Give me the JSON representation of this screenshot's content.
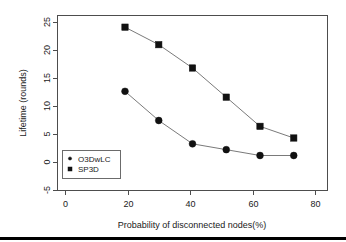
{
  "chart_data": {
    "type": "line",
    "title": "",
    "xlabel": "Probability of disconnected nodes(%)",
    "ylabel": "Lifetime (rounds)",
    "xlim": [
      0,
      80
    ],
    "ylim": [
      -5,
      25
    ],
    "xticks": [
      0,
      20,
      40,
      60,
      80
    ],
    "yticks": [
      -5,
      0,
      5,
      10,
      15,
      20,
      25
    ],
    "xtick_labels": [
      "0",
      "20",
      "40",
      "60",
      "80"
    ],
    "ytick_labels": [
      "-5",
      "0",
      "5",
      "10",
      "15",
      "20",
      "25"
    ],
    "grid": false,
    "legend_position": "lower-left-inside",
    "x": [
      20,
      30,
      40,
      50,
      60,
      70
    ],
    "series": [
      {
        "name": "O3DwLC",
        "marker": "circle",
        "values": [
          12,
          7,
          3,
          2,
          1,
          1
        ]
      },
      {
        "name": "SP3D",
        "marker": "square",
        "values": [
          23,
          20,
          16,
          11,
          6,
          4
        ]
      }
    ],
    "colors": {
      "marker": "#111111",
      "line": "#7a7a7a",
      "frame": "#4d4d4d",
      "text": "#1a1a1a",
      "background": "#ffffff",
      "rule": "#000000"
    }
  }
}
